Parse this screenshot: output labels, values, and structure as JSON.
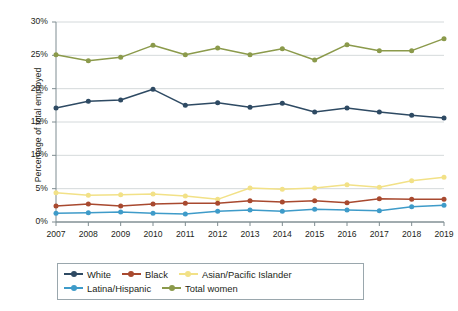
{
  "chart_data": {
    "type": "line",
    "title": "",
    "xlabel": "",
    "ylabel": "Percentage of total employed",
    "categories": [
      "2007",
      "2008",
      "2009",
      "2010",
      "2011",
      "2012",
      "2013",
      "2014",
      "2015",
      "2016",
      "2017",
      "2018",
      "2019"
    ],
    "x": [
      2007,
      2008,
      2009,
      2010,
      2011,
      2012,
      2013,
      2014,
      2015,
      2016,
      2017,
      2018,
      2019
    ],
    "ylim": [
      0,
      30
    ],
    "yticks": [
      0,
      5,
      10,
      15,
      20,
      25,
      30
    ],
    "ytick_labels": [
      "0%",
      "5%",
      "10%",
      "15%",
      "20%",
      "25%",
      "30%"
    ],
    "grid": true,
    "legend_position": "bottom",
    "series": [
      {
        "name": "White",
        "color": "#2e4a63",
        "values": [
          17.1,
          18.1,
          18.3,
          19.9,
          17.5,
          17.9,
          17.2,
          17.8,
          16.5,
          17.1,
          16.5,
          16.0,
          15.6
        ]
      },
      {
        "name": "Black",
        "color": "#a8492f",
        "values": [
          2.4,
          2.7,
          2.4,
          2.7,
          2.8,
          2.8,
          3.2,
          3.0,
          3.2,
          2.9,
          3.5,
          3.4,
          3.4
        ]
      },
      {
        "name": "Asian/Pacific Islander",
        "color": "#f2e187",
        "values": [
          4.4,
          4.0,
          4.1,
          4.2,
          3.9,
          3.4,
          5.1,
          4.9,
          5.1,
          5.6,
          5.2,
          6.2,
          6.7
        ]
      },
      {
        "name": "Latina/Hispanic",
        "color": "#3e9bc9",
        "values": [
          1.3,
          1.4,
          1.5,
          1.3,
          1.2,
          1.6,
          1.8,
          1.6,
          1.9,
          1.8,
          1.7,
          2.3,
          2.5
        ]
      },
      {
        "name": "Total women",
        "color": "#8b9a4b",
        "values": [
          25.1,
          24.2,
          24.7,
          26.5,
          25.1,
          26.1,
          25.1,
          26.0,
          24.3,
          26.6,
          25.7,
          25.7,
          27.5
        ]
      }
    ]
  },
  "axes": {
    "y_title": "Percentage of total employed"
  },
  "legend": {
    "row1": [
      "White",
      "Black",
      "Asian/Pacific Islander"
    ],
    "row2": [
      "Latina/Hispanic",
      "Total women"
    ]
  },
  "style": {
    "axis_color": "#7f8c91",
    "grid_color": "#c9cfd2",
    "text_color": "#231f20"
  }
}
